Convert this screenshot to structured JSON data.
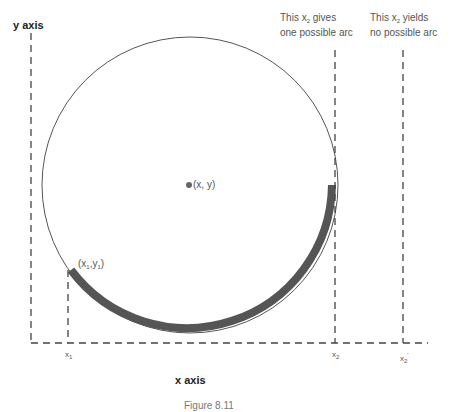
{
  "diagram": {
    "y_axis_label": "y axis",
    "x_axis_label": "x axis",
    "center_label": "(x, y)",
    "point1_label_open": "(x",
    "point1_sub_x": "1",
    "point1_mid": ",y",
    "point1_sub_y": "1",
    "point1_close": ")",
    "annot_x2_line1_pre": "This x",
    "annot_x2_line1_sub": "2",
    "annot_x2_line1_post": " gives",
    "annot_x2_line2": "one possible arc",
    "annot_x2p_line1_pre": "This x",
    "annot_x2p_line1_sub": "2",
    "annot_x2p_line1_post": " yields",
    "annot_x2p_line2": "no possible arc",
    "tick_x1": "x",
    "tick_x1_sub": "1",
    "tick_x2": "x",
    "tick_x2_sub": "2",
    "tick_x2p": "x",
    "tick_x2p_sub": "2",
    "tick_x2p_prime": "'",
    "caption": "Figure 8.11",
    "colors": {
      "circle": "#555555",
      "arc": "#555555",
      "dash": "#444444"
    }
  }
}
